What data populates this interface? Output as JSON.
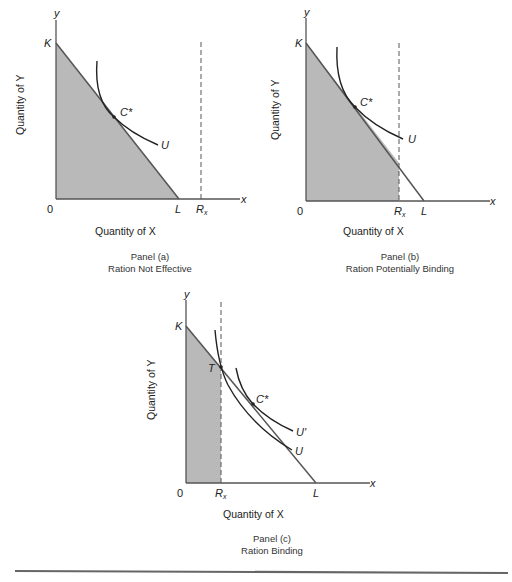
{
  "panels": [
    {
      "id": "a",
      "caption_title": "Panel (a)",
      "caption_subtitle": "Ration Not Effective",
      "x_axis_label": "Quantity of X",
      "y_axis_label": "Quantity of Y",
      "labels": {
        "origin": "0",
        "y": "y",
        "x": "x",
        "K": "K",
        "L": "L",
        "Rx": "R",
        "Rx_sub": "x",
        "C": "C*",
        "U": "U"
      }
    },
    {
      "id": "b",
      "caption_title": "Panel (b)",
      "caption_subtitle": "Ration Potentially Binding",
      "x_axis_label": "Quantity of X",
      "y_axis_label": "Quantity of Y",
      "labels": {
        "origin": "0",
        "y": "y",
        "x": "x",
        "K": "K",
        "L": "L",
        "Rx": "R",
        "Rx_sub": "x",
        "C": "C*",
        "U": "U"
      }
    },
    {
      "id": "c",
      "caption_title": "Panel (c)",
      "caption_subtitle": "Ration Binding",
      "x_axis_label": "Quantity of X",
      "y_axis_label": "Quantity of Y",
      "labels": {
        "origin": "0",
        "y": "y",
        "x": "x",
        "K": "K",
        "L": "L",
        "Rx": "R",
        "Rx_sub": "x",
        "C": "C*",
        "U": "U",
        "U_prime": "U'",
        "T": "T"
      }
    }
  ],
  "colors": {
    "shade": "#b9b9b9",
    "line": "#555555",
    "curve": "#222222",
    "rule": "#666666"
  }
}
